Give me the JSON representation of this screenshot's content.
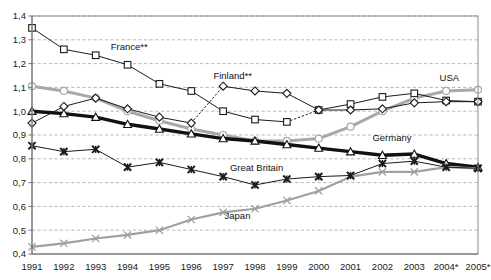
{
  "chart_data": {
    "type": "line",
    "title": "",
    "subtitle": "",
    "xlabel": "",
    "ylabel": "",
    "grid": "horizontal-dashed",
    "legend_position": "inline-labels",
    "decimal_separator": ",",
    "categories": [
      "1991",
      "1992",
      "1993",
      "1994",
      "1995",
      "1996",
      "1997",
      "1998",
      "1999",
      "2000",
      "2001",
      "2002",
      "2003",
      "2004*",
      "2005*"
    ],
    "xlim": [
      0,
      14
    ],
    "ylim": [
      0.4,
      1.4
    ],
    "ytick_values": [
      0.4,
      0.5,
      0.6,
      0.7,
      0.8,
      0.9,
      1.0,
      1.1,
      1.2,
      1.3,
      1.4
    ],
    "ytick_labels": [
      "0,4",
      "0,5",
      "0,6",
      "0,7",
      "0,8",
      "0,9",
      "1,0",
      "1,1",
      "1,2",
      "1,3",
      "1,4"
    ],
    "series": [
      {
        "name": "France**",
        "marker": "square-open",
        "color": "#1a1a1a",
        "line_style": "solid-with-dotted-gaps",
        "dotted_segments": [
          [
            8,
            9
          ]
        ],
        "values": [
          1.35,
          1.26,
          1.235,
          1.195,
          1.115,
          1.085,
          1.0,
          0.965,
          0.955,
          1.005,
          1.03,
          1.06,
          1.075,
          1.045,
          1.04
        ]
      },
      {
        "name": "Finland**",
        "marker": "diamond-open",
        "color": "#1a1a1a",
        "line_style": "solid-with-dotted-gaps",
        "dotted_segments": [
          [
            5,
            6
          ]
        ],
        "values": [
          0.95,
          1.02,
          1.055,
          1.01,
          0.975,
          0.95,
          1.105,
          1.085,
          1.075,
          1.005,
          1.005,
          1.01,
          1.035,
          1.04,
          1.04
        ]
      },
      {
        "name": "USA",
        "marker": "circle-open",
        "color": "#a8a8a8",
        "line_style": "solid-thick",
        "values": [
          1.105,
          1.085,
          1.055,
          1.0,
          0.96,
          0.925,
          0.9,
          0.875,
          0.875,
          0.885,
          0.935,
          1.0,
          1.055,
          1.085,
          1.09
        ]
      },
      {
        "name": "Germany",
        "marker": "triangle-open",
        "color": "#111111",
        "line_style": "solid-extra-thick",
        "values": [
          1.0,
          0.99,
          0.975,
          0.945,
          0.925,
          0.905,
          0.885,
          0.875,
          0.86,
          0.845,
          0.83,
          0.815,
          0.82,
          0.78,
          0.765
        ]
      },
      {
        "name": "Great Britain",
        "marker": "x-star",
        "color": "#1a1a1a",
        "line_style": "solid-thin",
        "values": [
          0.855,
          0.83,
          0.84,
          0.765,
          0.785,
          0.755,
          0.725,
          0.69,
          0.715,
          0.725,
          0.73,
          0.78,
          0.79,
          0.765,
          0.76
        ]
      },
      {
        "name": "Japan",
        "marker": "x-thin",
        "color": "#a0a0a0",
        "line_style": "solid-medium",
        "values": [
          0.43,
          0.445,
          0.465,
          0.48,
          0.5,
          0.545,
          0.575,
          0.59,
          0.625,
          0.665,
          0.725,
          0.745,
          0.745,
          0.765,
          0.76
        ]
      }
    ],
    "annotations": [
      {
        "text": "France**",
        "x_index": 3.05,
        "y_value": 1.258
      },
      {
        "text": "Finland**",
        "x_index": 6.3,
        "y_value": 1.135
      },
      {
        "text": "USA",
        "x_index": 13.1,
        "y_value": 1.125
      },
      {
        "text": "Germany",
        "x_index": 11.3,
        "y_value": 0.875
      },
      {
        "text": "Great Britain",
        "x_index": 7.05,
        "y_value": 0.748
      },
      {
        "text": "Japan",
        "x_index": 6.45,
        "y_value": 0.548
      }
    ]
  }
}
